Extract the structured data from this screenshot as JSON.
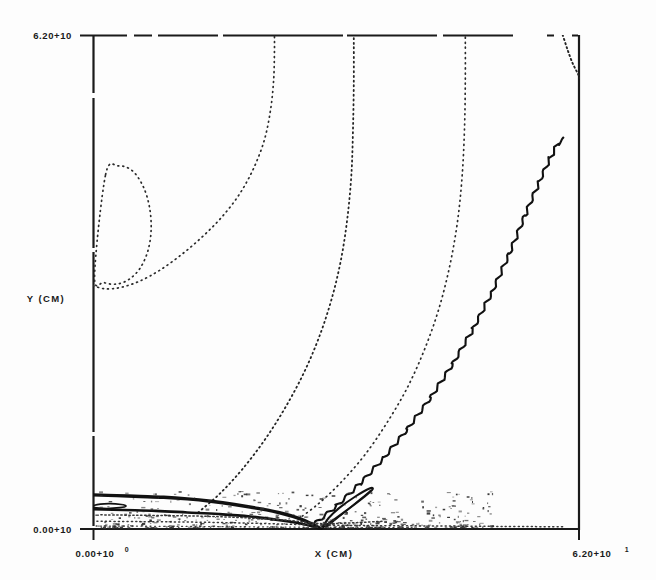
{
  "figure": {
    "title": "",
    "background_color": "#fdfdfd",
    "ink_color": "#1a1a1a"
  },
  "axes": {
    "x_title": "X (CM)",
    "y_title": "Y (CM)",
    "x_min_label": "0.00+10",
    "x_min_exp": "0",
    "x_max_label": "6.20+10",
    "x_max_exp": "1",
    "y_min_label": "0.00+10",
    "y_min_exp": "0",
    "y_max_label": "6.20+10",
    "y_max_exp": "1"
  },
  "chart_data": {
    "type": "line",
    "subtype": "contour",
    "title": "",
    "xlabel": "X (CM)",
    "ylabel": "Y (CM)",
    "xlim": [
      0.0,
      62.0
    ],
    "ylim": [
      0.0,
      62.0
    ],
    "xtick_labels": [
      "0.00+10",
      "6.20+10"
    ],
    "ytick_labels": [
      "0.00+10",
      "6.20+10"
    ],
    "grid": false,
    "legend": "none",
    "frame": {
      "left": 93,
      "right": 580,
      "top": 35,
      "bottom": 530
    },
    "series": [
      {
        "name": "closed-loop-contour-upper-left",
        "style": "dotted",
        "closed": true,
        "points": [
          [
            1.6,
            44.5
          ],
          [
            3.2,
            45.6
          ],
          [
            5.0,
            45.0
          ],
          [
            6.4,
            43.0
          ],
          [
            7.2,
            40.4
          ],
          [
            7.4,
            37.6
          ],
          [
            7.0,
            35.0
          ],
          [
            6.0,
            32.8
          ],
          [
            4.6,
            31.4
          ],
          [
            3.0,
            30.8
          ],
          [
            1.4,
            31.0
          ],
          [
            0.2,
            31.8
          ]
        ]
      },
      {
        "name": "contour-left-sweep",
        "style": "dotted",
        "closed": false,
        "points": [
          [
            0.0,
            30.6
          ],
          [
            1.6,
            30.2
          ],
          [
            3.6,
            30.4
          ],
          [
            6.0,
            31.2
          ],
          [
            8.6,
            32.6
          ],
          [
            11.4,
            34.6
          ],
          [
            14.0,
            36.8
          ],
          [
            16.4,
            39.2
          ],
          [
            18.6,
            42.0
          ],
          [
            20.4,
            45.2
          ],
          [
            21.8,
            48.8
          ],
          [
            22.6,
            52.6
          ],
          [
            23.0,
            56.4
          ],
          [
            23.1,
            60.0
          ],
          [
            23.1,
            62.0
          ]
        ]
      },
      {
        "name": "contour-mid-sweep",
        "style": "dotted",
        "closed": false,
        "points": [
          [
            13.4,
            2.2
          ],
          [
            16.2,
            4.6
          ],
          [
            19.0,
            7.6
          ],
          [
            21.8,
            11.2
          ],
          [
            24.4,
            15.2
          ],
          [
            26.8,
            19.6
          ],
          [
            28.8,
            24.2
          ],
          [
            30.4,
            29.0
          ],
          [
            31.6,
            34.0
          ],
          [
            32.4,
            39.2
          ],
          [
            32.9,
            44.6
          ],
          [
            33.1,
            50.2
          ],
          [
            33.2,
            56.0
          ],
          [
            33.2,
            62.0
          ]
        ]
      },
      {
        "name": "contour-right-sweep",
        "style": "dotted",
        "closed": false,
        "points": [
          [
            25.6,
            1.0
          ],
          [
            28.6,
            3.2
          ],
          [
            31.6,
            6.0
          ],
          [
            34.6,
            9.4
          ],
          [
            37.4,
            13.4
          ],
          [
            40.0,
            17.8
          ],
          [
            42.2,
            22.6
          ],
          [
            44.0,
            27.6
          ],
          [
            45.4,
            33.0
          ],
          [
            46.4,
            38.6
          ],
          [
            47.0,
            44.4
          ],
          [
            47.3,
            50.4
          ],
          [
            47.4,
            56.4
          ],
          [
            47.4,
            62.0
          ]
        ]
      },
      {
        "name": "contour-top-right-corner",
        "style": "dotted",
        "closed": false,
        "points": [
          [
            59.8,
            62.0
          ],
          [
            60.4,
            60.2
          ],
          [
            61.0,
            58.6
          ],
          [
            61.6,
            57.4
          ],
          [
            62.0,
            56.6
          ]
        ]
      },
      {
        "name": "shock-front-wavy",
        "style": "solid-wavy",
        "closed": false,
        "points": [
          [
            28.0,
            0.6
          ],
          [
            31.0,
            3.0
          ],
          [
            34.0,
            5.8
          ],
          [
            37.0,
            9.0
          ],
          [
            40.0,
            12.6
          ],
          [
            43.0,
            16.6
          ],
          [
            45.8,
            20.8
          ],
          [
            48.4,
            25.2
          ],
          [
            50.8,
            29.8
          ],
          [
            53.0,
            34.6
          ],
          [
            55.0,
            39.4
          ],
          [
            56.8,
            43.6
          ],
          [
            58.2,
            46.6
          ],
          [
            59.2,
            48.4
          ],
          [
            60.0,
            49.0
          ]
        ]
      },
      {
        "name": "bottom-dark-band-upper",
        "style": "solid-thick",
        "closed": false,
        "points": [
          [
            0.0,
            4.4
          ],
          [
            3.0,
            4.3
          ],
          [
            6.0,
            4.2
          ],
          [
            9.0,
            4.1
          ],
          [
            12.0,
            3.9
          ],
          [
            15.0,
            3.6
          ],
          [
            18.0,
            3.2
          ],
          [
            21.0,
            2.7
          ],
          [
            24.0,
            2.1
          ],
          [
            26.4,
            1.4
          ],
          [
            28.0,
            0.7
          ],
          [
            29.0,
            0.15
          ]
        ]
      },
      {
        "name": "bottom-dark-band-lower",
        "style": "solid-thick",
        "closed": false,
        "points": [
          [
            0.0,
            2.6
          ],
          [
            4.0,
            2.5
          ],
          [
            8.0,
            2.4
          ],
          [
            12.0,
            2.2
          ],
          [
            16.0,
            2.0
          ],
          [
            20.0,
            1.7
          ],
          [
            24.0,
            1.2
          ],
          [
            27.0,
            0.7
          ],
          [
            29.0,
            0.15
          ]
        ]
      },
      {
        "name": "cusp-spike",
        "style": "solid",
        "closed": true,
        "points": [
          [
            29.0,
            0.15
          ],
          [
            32.2,
            2.4
          ],
          [
            34.6,
            4.2
          ],
          [
            35.6,
            5.1
          ],
          [
            35.2,
            5.2
          ],
          [
            33.4,
            4.2
          ],
          [
            31.4,
            2.8
          ],
          [
            30.0,
            1.5
          ],
          [
            29.4,
            0.6
          ]
        ]
      },
      {
        "name": "cusp-spike-inner",
        "style": "solid",
        "closed": false,
        "points": [
          [
            29.6,
            0.3
          ],
          [
            32.0,
            2.2
          ],
          [
            34.2,
            4.0
          ],
          [
            35.4,
            5.0
          ]
        ]
      },
      {
        "name": "small-closed-loop-left",
        "style": "solid",
        "closed": true,
        "points": [
          [
            0.2,
            3.1
          ],
          [
            2.0,
            3.3
          ],
          [
            3.6,
            3.2
          ],
          [
            4.2,
            3.0
          ],
          [
            3.4,
            2.8
          ],
          [
            1.8,
            2.7
          ],
          [
            0.2,
            2.8
          ]
        ]
      },
      {
        "name": "lower-noise-contour-a",
        "style": "dotted",
        "closed": false,
        "points": [
          [
            1.0,
            1.9
          ],
          [
            5.0,
            1.85
          ],
          [
            10.0,
            1.8
          ],
          [
            15.0,
            1.7
          ],
          [
            20.0,
            1.5
          ],
          [
            25.0,
            1.2
          ],
          [
            29.0,
            0.8
          ],
          [
            33.0,
            0.9
          ],
          [
            37.0,
            1.1
          ]
        ]
      },
      {
        "name": "lower-noise-contour-b",
        "style": "dotted",
        "closed": false,
        "points": [
          [
            0.5,
            1.1
          ],
          [
            6.0,
            1.05
          ],
          [
            12.0,
            1.0
          ],
          [
            18.0,
            0.9
          ],
          [
            24.0,
            0.75
          ],
          [
            30.0,
            0.6
          ],
          [
            36.0,
            0.55
          ],
          [
            44.0,
            0.5
          ],
          [
            52.0,
            0.45
          ],
          [
            60.0,
            0.4
          ]
        ]
      },
      {
        "name": "lower-noise-contour-c",
        "style": "dotted",
        "closed": false,
        "points": [
          [
            0.4,
            0.5
          ],
          [
            5.0,
            0.48
          ],
          [
            11.0,
            0.45
          ],
          [
            17.0,
            0.42
          ],
          [
            23.0,
            0.38
          ],
          [
            29.0,
            0.33
          ],
          [
            35.0,
            0.3
          ],
          [
            41.0,
            0.28
          ]
        ]
      }
    ]
  }
}
